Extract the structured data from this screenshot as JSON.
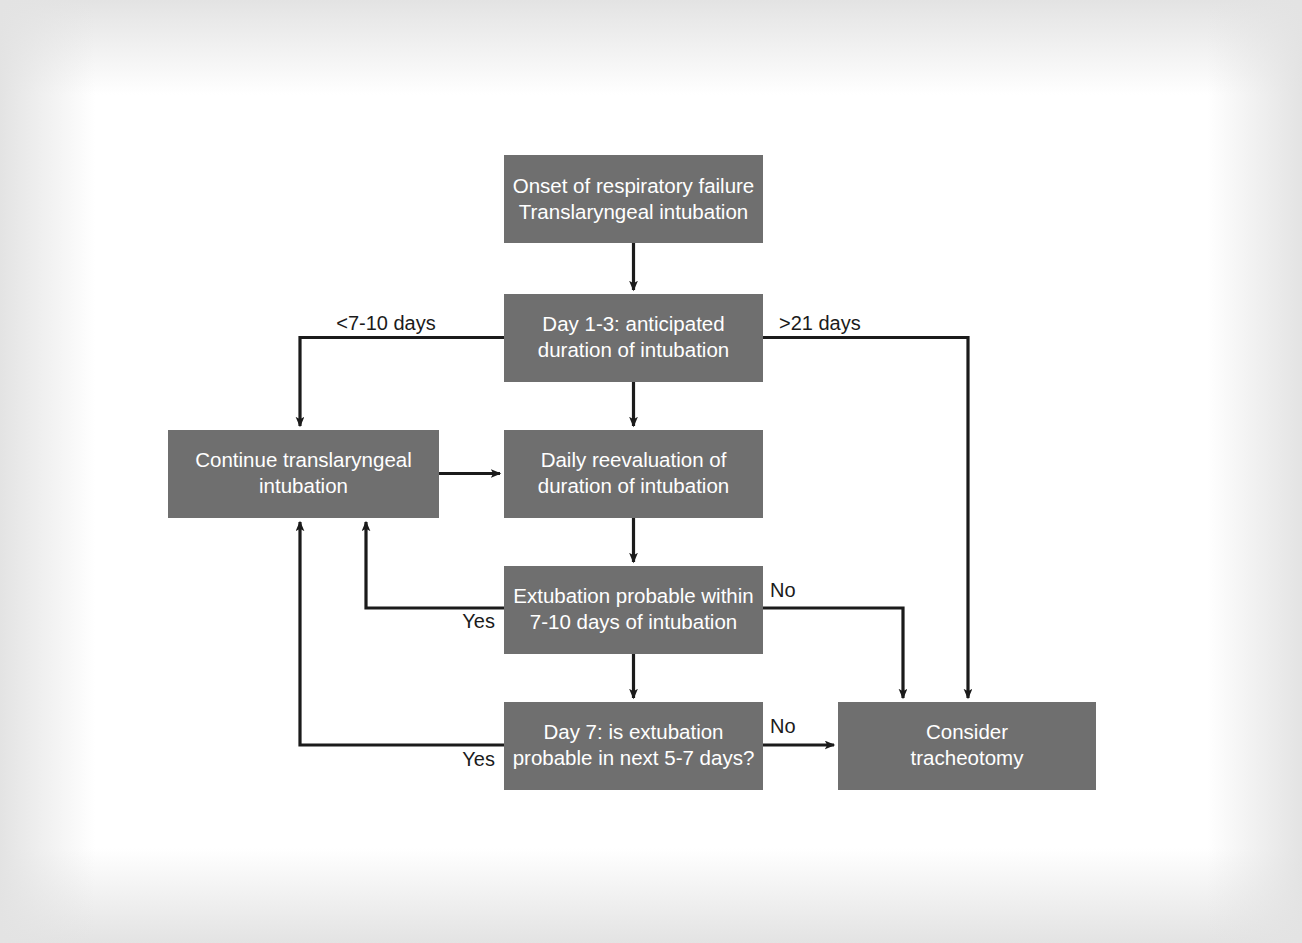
{
  "figure": {
    "kind": "clinical-decision-flowchart",
    "topic": "Timing of tracheotomy in respiratory failure",
    "box_fill_color": "#6f6f6f",
    "box_text_color": "#ffffff",
    "line_color": "#1b1b1b",
    "background_color": "#ffffff"
  },
  "nodes": [
    {
      "id": "onset",
      "lines": [
        "Onset of respiratory failure",
        "Translaryngeal intubation"
      ],
      "x": 504,
      "y": 155,
      "w": 259,
      "h": 88
    },
    {
      "id": "day13",
      "lines": [
        "Day 1-3: anticipated",
        "duration of intubation"
      ],
      "x": 504,
      "y": 294,
      "w": 259,
      "h": 88
    },
    {
      "id": "continue",
      "lines": [
        "Continue translaryngeal",
        "intubation"
      ],
      "x": 168,
      "y": 430,
      "w": 271,
      "h": 88
    },
    {
      "id": "daily",
      "lines": [
        "Daily reevaluation of",
        "duration of intubation"
      ],
      "x": 504,
      "y": 430,
      "w": 259,
      "h": 88
    },
    {
      "id": "extubation",
      "lines": [
        "Extubation probable within",
        "7-10 days of intubation"
      ],
      "x": 504,
      "y": 566,
      "w": 259,
      "h": 88
    },
    {
      "id": "day7",
      "lines": [
        "Day 7: is extubation",
        "probable in next 5-7 days?"
      ],
      "x": 504,
      "y": 702,
      "w": 259,
      "h": 88
    },
    {
      "id": "tracheotomy",
      "lines": [
        "Consider",
        "tracheotomy"
      ],
      "x": 838,
      "y": 702,
      "w": 258,
      "h": 88
    }
  ],
  "edges": [
    {
      "id": "onset-to-day13",
      "from": "onset",
      "to": "day13",
      "label": ""
    },
    {
      "id": "day13-short-duration",
      "from": "day13",
      "to": "continue",
      "label": "<7-10 days"
    },
    {
      "id": "day13-long-duration",
      "from": "day13",
      "to": "tracheotomy",
      "label": ">21 days"
    },
    {
      "id": "day13-to-daily",
      "from": "day13",
      "to": "daily",
      "label": ""
    },
    {
      "id": "continue-to-daily",
      "from": "continue",
      "to": "daily",
      "label": ""
    },
    {
      "id": "daily-to-extubation",
      "from": "daily",
      "to": "extubation",
      "label": ""
    },
    {
      "id": "extubation-yes",
      "from": "extubation",
      "to": "continue",
      "label": "Yes"
    },
    {
      "id": "extubation-no",
      "from": "extubation",
      "to": "tracheotomy",
      "label": "No"
    },
    {
      "id": "extubation-to-day7",
      "from": "extubation",
      "to": "day7",
      "label": ""
    },
    {
      "id": "day7-yes",
      "from": "day7",
      "to": "continue",
      "label": "Yes"
    },
    {
      "id": "day7-no",
      "from": "day7",
      "to": "tracheotomy",
      "label": "No"
    }
  ],
  "edge_labels": {
    "short_duration": "<7-10 days",
    "long_duration": ">21 days",
    "extubation_yes": "Yes",
    "extubation_no": "No",
    "day7_yes": "Yes",
    "day7_no": "No"
  },
  "node_text": {
    "onset": {
      "l1": "Onset of respiratory failure",
      "l2": "Translaryngeal intubation"
    },
    "day13": {
      "l1": "Day 1-3: anticipated",
      "l2": "duration of intubation"
    },
    "continue": {
      "l1": "Continue translaryngeal",
      "l2": "intubation"
    },
    "daily": {
      "l1": "Daily reevaluation of",
      "l2": "duration of intubation"
    },
    "extubation": {
      "l1": "Extubation probable within",
      "l2": "7-10 days of intubation"
    },
    "day7": {
      "l1": "Day 7: is extubation",
      "l2": "probable in next 5-7 days?"
    },
    "tracheotomy": {
      "l1": "Consider",
      "l2": "tracheotomy"
    }
  }
}
